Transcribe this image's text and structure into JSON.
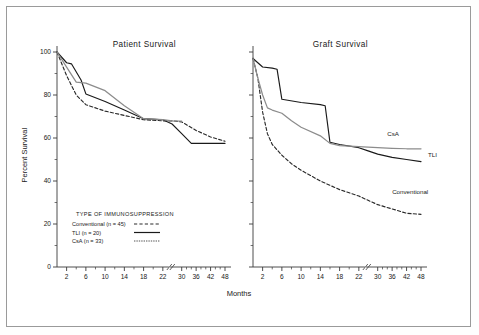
{
  "figure": {
    "background": "#ffffff",
    "frame_color": "#9a9a9a",
    "y_axis_label": "Percent Survival",
    "x_axis_label": "Months"
  },
  "colors": {
    "conventional": "#2a2a2a",
    "tli": "#1a1a1a",
    "csa": "#8c8c8c",
    "axis": "#3a3a3a"
  },
  "legend": {
    "title": "TYPE OF IMMUNOSUPPRESSION",
    "entries": [
      {
        "label": "Conventional (n = 45)",
        "style": "dashed",
        "color": "#2a2a2a"
      },
      {
        "label": "TLI (n = 20)",
        "style": "solid",
        "color": "#1a1a1a"
      },
      {
        "label": "CsA (n = 33)",
        "style": "gray",
        "color": "#8c8c8c"
      }
    ]
  },
  "annotations": {
    "csa": "CsA",
    "tli": "TLI",
    "conventional": "Conventional"
  },
  "chart_data": [
    {
      "type": "line",
      "title": "Patient Survival",
      "xlabel": "Months",
      "ylabel": "Percent Survival",
      "ylim": [
        0,
        100
      ],
      "xlim": [
        0,
        48
      ],
      "yticks": [
        0,
        20,
        40,
        60,
        80,
        100
      ],
      "yminor": [
        10,
        30,
        50,
        70,
        90
      ],
      "xticks": [
        2,
        6,
        10,
        14,
        18,
        22,
        30,
        36,
        42,
        48
      ],
      "xminor": [
        4,
        8,
        12,
        16,
        20,
        32,
        34,
        38,
        40,
        44,
        46
      ],
      "axis_break_after": 22,
      "grid": false,
      "legend_position": "inside-lower-left",
      "series": [
        {
          "name": "Conventional (n = 45)",
          "style": "dashed",
          "color": "#2a2a2a",
          "points": [
            [
              0,
              100
            ],
            [
              2,
              89
            ],
            [
              4,
              80
            ],
            [
              6,
              75.5
            ],
            [
              10,
              72.5
            ],
            [
              14,
              70.5
            ],
            [
              18,
              68.5
            ],
            [
              22,
              68.0
            ],
            [
              26,
              68.0
            ],
            [
              30,
              67.5
            ],
            [
              36,
              63.5
            ],
            [
              42,
              60.5
            ],
            [
              48,
              58.5
            ]
          ]
        },
        {
          "name": "TLI (n = 20)",
          "style": "solid",
          "color": "#1a1a1a",
          "points": [
            [
              0,
              100
            ],
            [
              2,
              95
            ],
            [
              3,
              94.5
            ],
            [
              5,
              87
            ],
            [
              6,
              80.5
            ],
            [
              10,
              77
            ],
            [
              14,
              73
            ],
            [
              18,
              69
            ],
            [
              22,
              68.5
            ],
            [
              26,
              66.5
            ],
            [
              30,
              62
            ],
            [
              34,
              57.5
            ],
            [
              42,
              57.5
            ],
            [
              48,
              57.5
            ]
          ]
        },
        {
          "name": "CsA (n = 33)",
          "style": "gray",
          "color": "#8c8c8c",
          "points": [
            [
              0,
              100
            ],
            [
              2,
              93
            ],
            [
              4,
              86
            ],
            [
              6,
              85.5
            ],
            [
              10,
              82
            ],
            [
              14,
              75
            ],
            [
              18,
              69
            ],
            [
              22,
              68.5
            ],
            [
              26,
              68.0
            ],
            [
              30,
              67.8
            ]
          ]
        }
      ]
    },
    {
      "type": "line",
      "title": "Graft Survival",
      "xlabel": "Months",
      "ylabel": "Percent Survival",
      "ylim": [
        0,
        100
      ],
      "xlim": [
        0,
        48
      ],
      "yticks": [
        0,
        20,
        40,
        60,
        80,
        100
      ],
      "yminor": [
        10,
        30,
        50,
        70,
        90
      ],
      "xticks": [
        2,
        6,
        10,
        14,
        18,
        22,
        30,
        36,
        42,
        48
      ],
      "xminor": [
        4,
        8,
        12,
        16,
        20,
        32,
        34,
        38,
        40,
        44,
        46
      ],
      "axis_break_after": 22,
      "grid": false,
      "legend_position": "inline-curve-labels",
      "series": [
        {
          "name": "Conventional (n = 45)",
          "style": "dashed",
          "color": "#2a2a2a",
          "points": [
            [
              0,
              97
            ],
            [
              1,
              88
            ],
            [
              2,
              72
            ],
            [
              3,
              62
            ],
            [
              4,
              57
            ],
            [
              6,
              52
            ],
            [
              8,
              48
            ],
            [
              10,
              45
            ],
            [
              14,
              40
            ],
            [
              18,
              36
            ],
            [
              22,
              33
            ],
            [
              26,
              31
            ],
            [
              30,
              29
            ],
            [
              36,
              27
            ],
            [
              42,
              25
            ],
            [
              48,
              24.5
            ]
          ]
        },
        {
          "name": "TLI (n = 20)",
          "style": "solid",
          "color": "#1a1a1a",
          "points": [
            [
              0,
              97
            ],
            [
              2,
              93
            ],
            [
              4,
              92.5
            ],
            [
              5,
              92
            ],
            [
              6,
              78
            ],
            [
              10,
              76.5
            ],
            [
              14,
              75.5
            ],
            [
              15,
              75
            ],
            [
              16,
              58
            ],
            [
              18,
              57
            ],
            [
              22,
              55.5
            ],
            [
              26,
              54
            ],
            [
              30,
              52.5
            ],
            [
              36,
              51
            ],
            [
              42,
              50
            ],
            [
              48,
              49
            ]
          ]
        },
        {
          "name": "CsA (n = 33)",
          "style": "gray",
          "color": "#8c8c8c",
          "points": [
            [
              0,
              97
            ],
            [
              1,
              88
            ],
            [
              2,
              80
            ],
            [
              3,
              74
            ],
            [
              4,
              73
            ],
            [
              6,
              71.5
            ],
            [
              8,
              68
            ],
            [
              10,
              65
            ],
            [
              14,
              61
            ],
            [
              16,
              57.5
            ],
            [
              18,
              56.5
            ],
            [
              22,
              56
            ],
            [
              26,
              55.8
            ],
            [
              30,
              55.5
            ],
            [
              36,
              55.2
            ],
            [
              42,
              55
            ],
            [
              48,
              55
            ]
          ]
        }
      ]
    }
  ]
}
